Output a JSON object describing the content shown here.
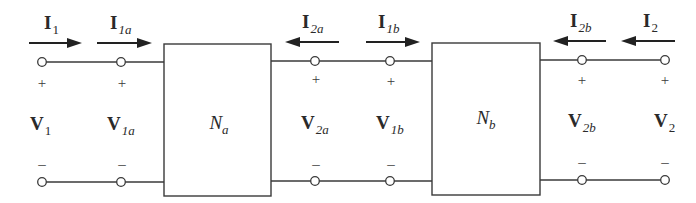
{
  "diagram": {
    "colors": {
      "stroke": "#3a3a3a",
      "text": "#2a2a2a",
      "background": "#ffffff"
    },
    "networks": [
      {
        "id": "Na",
        "name": "N",
        "sub": "a"
      },
      {
        "id": "Nb",
        "name": "N",
        "sub": "b"
      }
    ],
    "currents": [
      {
        "id": "I1",
        "name": "I",
        "sub": "1",
        "direction": "right"
      },
      {
        "id": "I1a",
        "name": "I",
        "sub": "1a",
        "direction": "right"
      },
      {
        "id": "I2a",
        "name": "I",
        "sub": "2a",
        "direction": "left"
      },
      {
        "id": "I1b",
        "name": "I",
        "sub": "1b",
        "direction": "right"
      },
      {
        "id": "I2b",
        "name": "I",
        "sub": "2b",
        "direction": "left"
      },
      {
        "id": "I2",
        "name": "I",
        "sub": "2",
        "direction": "left"
      }
    ],
    "voltages": [
      {
        "id": "V1",
        "name": "V",
        "sub": "1",
        "plus": "+",
        "minus": "–"
      },
      {
        "id": "V1a",
        "name": "V",
        "sub": "1a",
        "plus": "+",
        "minus": "–"
      },
      {
        "id": "V2a",
        "name": "V",
        "sub": "2a",
        "plus": "+",
        "minus": "–"
      },
      {
        "id": "V1b",
        "name": "V",
        "sub": "1b",
        "plus": "+",
        "minus": "–"
      },
      {
        "id": "V2b",
        "name": "V",
        "sub": "2b",
        "plus": "+",
        "minus": "–"
      },
      {
        "id": "V2",
        "name": "V",
        "sub": "2",
        "plus": "+",
        "minus": "–"
      }
    ]
  }
}
